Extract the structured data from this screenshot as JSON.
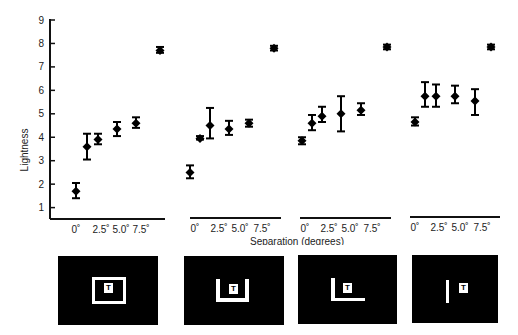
{
  "chart_data": {
    "type": "scatter",
    "title": "",
    "ylabel": "Lightness",
    "xlabel": "Separation (degrees)",
    "ylim": [
      0.5,
      9
    ],
    "yticks": [
      1,
      2,
      3,
      4,
      5,
      6,
      7,
      8,
      9
    ],
    "xtick_labels": [
      "0˚",
      "2.5˚",
      "5.0˚",
      "7.5˚"
    ],
    "grid": false,
    "legend": null,
    "error_bars": true,
    "panels": [
      {
        "name": "full-frame",
        "points": [
          {
            "x": 0.0,
            "y": 1.7,
            "lo": 1.4,
            "hi": 2.05
          },
          {
            "x": 1.25,
            "y": 3.6,
            "lo": 3.05,
            "hi": 4.15
          },
          {
            "x": 2.5,
            "y": 3.9,
            "lo": 3.7,
            "hi": 4.15
          },
          {
            "x": 5.0,
            "y": 4.35,
            "lo": 4.05,
            "hi": 4.65
          },
          {
            "x": 7.5,
            "y": 4.6,
            "lo": 4.4,
            "hi": 4.85
          }
        ],
        "reference": {
          "y": 7.7,
          "lo": 7.6,
          "hi": 7.85
        }
      },
      {
        "name": "three-sided-frame",
        "points": [
          {
            "x": 0.0,
            "y": 2.5,
            "lo": 2.25,
            "hi": 2.8
          },
          {
            "x": 1.25,
            "y": 3.95,
            "lo": 3.9,
            "hi": 4.05
          },
          {
            "x": 2.5,
            "y": 4.5,
            "lo": 3.95,
            "hi": 5.25
          },
          {
            "x": 5.0,
            "y": 4.35,
            "lo": 4.1,
            "hi": 4.7
          },
          {
            "x": 7.5,
            "y": 4.6,
            "lo": 4.45,
            "hi": 4.75
          }
        ],
        "reference": {
          "y": 7.8,
          "lo": 7.7,
          "hi": 7.9
        }
      },
      {
        "name": "two-sided-frame",
        "points": [
          {
            "x": 0.0,
            "y": 3.85,
            "lo": 3.7,
            "hi": 4.0
          },
          {
            "x": 1.25,
            "y": 4.6,
            "lo": 4.3,
            "hi": 4.95
          },
          {
            "x": 2.5,
            "y": 4.9,
            "lo": 4.65,
            "hi": 5.3
          },
          {
            "x": 5.0,
            "y": 5.0,
            "lo": 4.25,
            "hi": 5.75
          },
          {
            "x": 7.5,
            "y": 5.15,
            "lo": 4.95,
            "hi": 5.45
          }
        ],
        "reference": {
          "y": 7.85,
          "lo": 7.75,
          "hi": 7.95
        }
      },
      {
        "name": "one-sided-frame",
        "points": [
          {
            "x": 0.0,
            "y": 4.65,
            "lo": 4.5,
            "hi": 4.85
          },
          {
            "x": 1.25,
            "y": 5.75,
            "lo": 5.3,
            "hi": 6.35
          },
          {
            "x": 2.5,
            "y": 5.75,
            "lo": 5.3,
            "hi": 6.25
          },
          {
            "x": 5.0,
            "y": 5.75,
            "lo": 5.45,
            "hi": 6.2
          },
          {
            "x": 7.5,
            "y": 5.55,
            "lo": 4.95,
            "hi": 6.05
          }
        ],
        "reference": {
          "y": 7.85,
          "lo": 7.75,
          "hi": 7.95
        }
      }
    ]
  },
  "labels": {
    "ylabel": "Lightness",
    "xlabel": "Separation (degrees)",
    "ytick": [
      "1",
      "2",
      "3",
      "4",
      "5",
      "6",
      "7",
      "8",
      "9"
    ],
    "xtick": [
      "0˚",
      "2.5˚",
      "5.0˚",
      "7.5˚"
    ],
    "target_letter": "T"
  },
  "stimuli": [
    {
      "name": "full-frame",
      "label": "T"
    },
    {
      "name": "three-sided-frame",
      "label": "T"
    },
    {
      "name": "two-sided-frame",
      "label": "T"
    },
    {
      "name": "one-sided-frame",
      "label": "T"
    }
  ]
}
